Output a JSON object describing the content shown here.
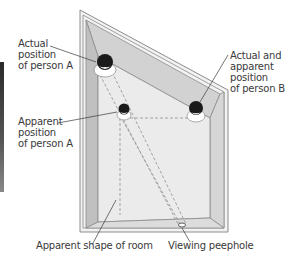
{
  "diagram": {
    "labels": {
      "actual_a": "Actual\nposition\nof person A",
      "apparent_a": "Apparent\nposition\nof person A",
      "person_b": "Actual and\napparent\nposition\nof person B",
      "apparent_room": "Apparent shape of room",
      "peephole": "Viewing peephole"
    },
    "colors": {
      "wall_light": "#e6e6e6",
      "wall_dark": "#bdbdbd",
      "floor": "#f0f0f0",
      "outline": "#8c8c8c",
      "dashed": "#9a9a9a",
      "text": "#3a3a3a"
    }
  }
}
